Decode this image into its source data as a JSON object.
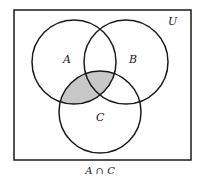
{
  "diagram": {
    "type": "venn",
    "universe_label": "U",
    "sets": [
      {
        "name": "A",
        "label": "A"
      },
      {
        "name": "B",
        "label": "B"
      },
      {
        "name": "C",
        "label": "C"
      }
    ],
    "shaded_region": "A ∩ C",
    "shade_color": "#c8c8c8",
    "caption": "A ∩ C"
  }
}
